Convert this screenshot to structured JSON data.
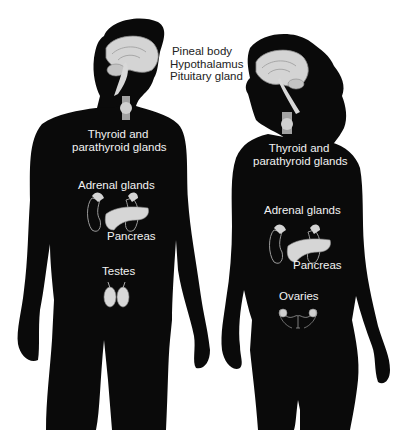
{
  "figure": {
    "type": "endocrine-glands-diagram",
    "colors": {
      "silhouette": "#0a0a0a",
      "organ": "#d4d4d4",
      "organ_outline": "#8a8a8a",
      "label_on_dark": "#f2f2f2",
      "label_on_light": "#222222",
      "background": "#ffffff"
    },
    "center_labels": {
      "line1": "Pineal body",
      "line2": "Hypothalamus",
      "line3": "Pituitary gland"
    },
    "male": {
      "thyroid_line1": "Thyroid and",
      "thyroid_line2": "parathyroid glands",
      "adrenal": "Adrenal glands",
      "pancreas": "Pancreas",
      "gonads": "Testes"
    },
    "female": {
      "thyroid_line1": "Thyroid and",
      "thyroid_line2": "parathyroid glands",
      "adrenal": "Adrenal glands",
      "pancreas": "Pancreas",
      "gonads": "Ovaries"
    }
  }
}
